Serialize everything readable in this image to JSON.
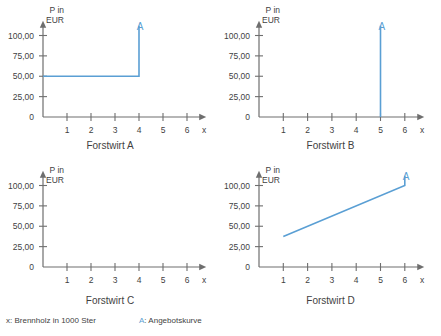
{
  "figure": {
    "axis_caption": "P in\nEUR",
    "x_axis_symbol": "x",
    "y_ticks": [
      "0",
      "25,00",
      "50,00",
      "75,00",
      "100,00"
    ],
    "x_ticks": [
      "1",
      "2",
      "3",
      "4",
      "5",
      "6"
    ],
    "curve_label": "A",
    "curve_color": "#5a9fd4",
    "axis_color": "#6e6e6e",
    "text_color": "#3f3f3f"
  },
  "legend": {
    "x_label": "x: Brennholz in 1000 Ster",
    "a_mark": "A",
    "a_separator": ":",
    "a_label": "Angebotskurve"
  },
  "panels": [
    {
      "title": "Forstwirt A"
    },
    {
      "title": "Forstwirt B"
    },
    {
      "title": "Forstwirt C"
    },
    {
      "title": "Forstwirt D"
    }
  ],
  "chart_data": [
    {
      "type": "line",
      "title": "Forstwirt A",
      "xlabel": "x: Brennholz in 1000 Ster",
      "ylabel": "P in EUR",
      "xlim": [
        0,
        6.8
      ],
      "ylim": [
        0,
        118
      ],
      "xticks": [
        1,
        2,
        3,
        4,
        5,
        6
      ],
      "yticks": [
        0,
        25,
        50,
        75,
        100
      ],
      "ytick_labels": [
        "0",
        "25,00",
        "50,00",
        "75,00",
        "100,00"
      ],
      "grid": false,
      "legend": "A: Angebotskurve",
      "annotations": [
        {
          "text": "A",
          "x": 4.05,
          "y": 118
        }
      ],
      "series": [
        {
          "name": "A",
          "color": "#5a9fd4",
          "comment": "horizontal at P=50 from x=0 to x=4, then vertical at x=4 up to top of axis",
          "points": [
            {
              "x": 0.0,
              "y": 50
            },
            {
              "x": 4.0,
              "y": 50
            },
            {
              "x": 4.0,
              "y": 112
            }
          ]
        }
      ]
    },
    {
      "type": "line",
      "title": "Forstwirt B",
      "xlabel": "x: Brennholz in 1000 Ster",
      "ylabel": "P in EUR",
      "xlim": [
        0,
        6.8
      ],
      "ylim": [
        0,
        118
      ],
      "xticks": [
        1,
        2,
        3,
        4,
        5,
        6
      ],
      "yticks": [
        0,
        25,
        50,
        75,
        100
      ],
      "ytick_labels": [
        "0",
        "25,00",
        "50,00",
        "75,00",
        "100,00"
      ],
      "grid": false,
      "legend": "A: Angebotskurve",
      "annotations": [
        {
          "text": "A",
          "x": 5.05,
          "y": 118
        }
      ],
      "series": [
        {
          "name": "A",
          "color": "#5a9fd4",
          "comment": "vertical line at x=5 from P=0 to top of axis",
          "points": [
            {
              "x": 5.0,
              "y": 0
            },
            {
              "x": 5.0,
              "y": 112
            }
          ]
        }
      ]
    },
    {
      "type": "line",
      "title": "Forstwirt C",
      "xlabel": "x: Brennholz in 1000 Ster",
      "ylabel": "P in EUR",
      "xlim": [
        0,
        6.8
      ],
      "ylim": [
        0,
        118
      ],
      "xticks": [
        1,
        2,
        3,
        4,
        5,
        6
      ],
      "yticks": [
        0,
        25,
        50,
        75,
        100
      ],
      "ytick_labels": [
        "0",
        "25,00",
        "50,00",
        "75,00",
        "100,00"
      ],
      "grid": false,
      "legend": "A: Angebotskurve",
      "annotations": [],
      "series": [
        {
          "name": "A",
          "color": "#5a9fd4",
          "comment": "empty axes - no curve drawn",
          "points": []
        }
      ]
    },
    {
      "type": "line",
      "title": "Forstwirt D",
      "xlabel": "x: Brennholz in 1000 Ster",
      "ylabel": "P in EUR",
      "xlim": [
        0,
        6.8
      ],
      "ylim": [
        0,
        118
      ],
      "xticks": [
        1,
        2,
        3,
        4,
        5,
        6
      ],
      "yticks": [
        0,
        25,
        50,
        75,
        100
      ],
      "ytick_labels": [
        "0",
        "25,00",
        "50,00",
        "75,00",
        "100,00"
      ],
      "grid": false,
      "legend": "A: Angebotskurve",
      "annotations": [
        {
          "text": "A",
          "x": 6.05,
          "y": 118
        }
      ],
      "series": [
        {
          "name": "A",
          "color": "#5a9fd4",
          "comment": "rising line from (1, 37.5) to (6, 100), then vertical at x=6 up to top of axis",
          "points": [
            {
              "x": 1.0,
              "y": 37.5
            },
            {
              "x": 6.0,
              "y": 100
            },
            {
              "x": 6.0,
              "y": 112
            }
          ]
        }
      ]
    }
  ]
}
